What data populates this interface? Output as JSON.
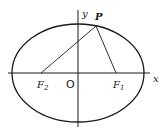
{
  "diagram": {
    "labels": {
      "y_axis": "y",
      "x_axis": "x",
      "point": "P",
      "origin": "O",
      "focus2": "F",
      "focus2_sub": "2",
      "focus1": "F",
      "focus1_sub": "1"
    },
    "colors": {
      "stroke": "#1a1a1a",
      "background": "#ffffff"
    },
    "geometry": {
      "center": [
        78,
        73
      ],
      "rx": 66,
      "ry": 49,
      "F2": [
        41,
        73
      ],
      "F1": [
        116,
        73
      ],
      "P": [
        96,
        26
      ]
    }
  }
}
